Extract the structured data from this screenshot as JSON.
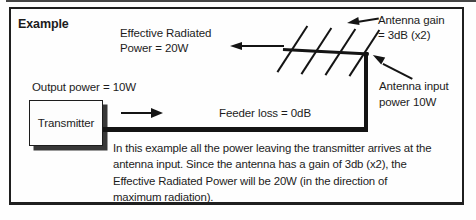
{
  "figure": {
    "title": "Example",
    "kind": "antenna-gain-example-diagram"
  },
  "labels": {
    "effective_radiated_power": {
      "line1": "Effective Radiated",
      "line2": "Power = 20W"
    },
    "output_power": "Output power = 10W",
    "transmitter": "Transmitter",
    "feeder_loss": "Feeder loss = 0dB",
    "antenna_gain": {
      "line1": "Antenna gain",
      "line2": "= 3dB (x2)"
    },
    "antenna_input": {
      "line1": "Antenna input",
      "line2": "power 10W"
    }
  },
  "body": {
    "lines": [
      "In this example all the power leaving the transmitter arrives at the",
      "antenna input. Since the antenna has a gain of 3db (x2), the",
      "Effective Radiated Power will be 20W (in the direction of",
      "maximum radiation)."
    ]
  },
  "icons": {
    "erp_arrow": "left-arrow",
    "feeder_arrow": "right-arrow",
    "gain_pointer": "left-arrow-pointer",
    "input_pointer": "up-left-arrow-pointer"
  },
  "colors": {
    "ink": "#1c1c1c",
    "line": "#141414",
    "frame_border": "#1f1f1f",
    "box_shadow": "#383838",
    "paper": "#fefefe",
    "scan_edge": "#454545"
  }
}
